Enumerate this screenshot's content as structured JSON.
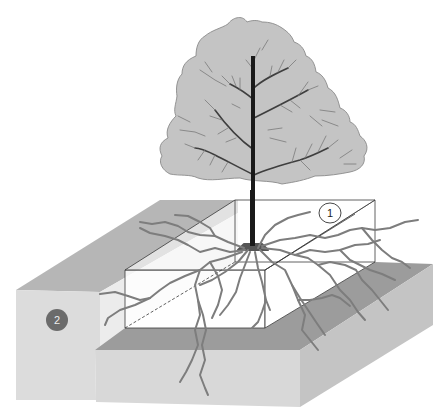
{
  "diagram": {
    "labels": [
      {
        "id": "1",
        "text": "1",
        "style": "outlined-circle",
        "target": "planting-pit"
      },
      {
        "id": "2",
        "text": "2",
        "style": "filled-dark-circle",
        "target": "surrounding-soil"
      }
    ],
    "colors": {
      "canopy_fill": "#c4c4c4",
      "canopy_outline": "#8a8a8a",
      "trunk": "#1a1a1a",
      "branch": "#4a4a4a",
      "twig": "#7a7a7a",
      "root": "#7d7d7d",
      "soil_top": "#b4b4b4",
      "soil_front": "#dadada",
      "soil_side": "#c8c8c8",
      "pit_floor": "#9a9a9a",
      "label2_fill": "#6b6b6b"
    }
  }
}
